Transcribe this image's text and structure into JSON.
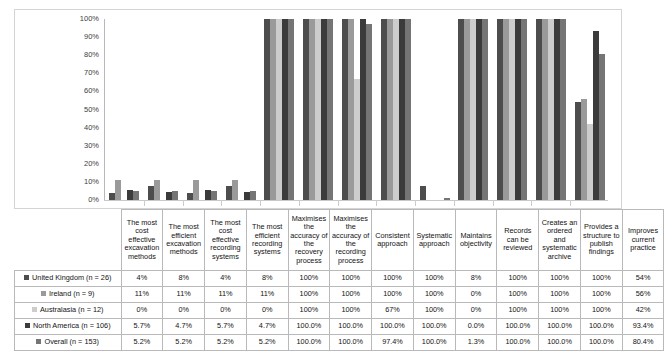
{
  "chart_data": {
    "type": "bar",
    "title": "",
    "xlabel": "",
    "ylabel": "",
    "ylim": [
      0,
      100
    ],
    "grid": false,
    "legend_position": "table-row-headers",
    "ytick_labels": [
      "100%",
      "90%",
      "80%",
      "70%",
      "60%",
      "50%",
      "40%",
      "30%",
      "20%",
      "10%",
      "0%"
    ],
    "ytick_values": [
      100,
      90,
      80,
      70,
      60,
      50,
      40,
      30,
      20,
      10,
      0
    ],
    "categories": [
      "The most cost effective excavation methods",
      "The most efficient excavation methods",
      "The most cost effective recording systems",
      "The most efficient recording systems",
      "Maximises the accuracy of the recovery process",
      "Maximises the accuracy of the recording process",
      "Consistent approach",
      "Systematic approach",
      "Maintains objectivity",
      "Records can be reviewed",
      "Creates an ordered and systematic archive",
      "Provides a structure to publish findings",
      "Improves current practice"
    ],
    "series": [
      {
        "name": "United Kingdom (n = 26)",
        "color": "#4d4d4d",
        "values": [
          4,
          8,
          4,
          8,
          100,
          100,
          100,
          100,
          8,
          100,
          100,
          100,
          54
        ],
        "labels": [
          "4%",
          "8%",
          "4%",
          "8%",
          "100%",
          "100%",
          "100%",
          "100%",
          "8%",
          "100%",
          "100%",
          "100%",
          "54%"
        ]
      },
      {
        "name": "Ireland (n = 9)",
        "color": "#9a9a9a",
        "values": [
          11,
          11,
          11,
          11,
          100,
          100,
          100,
          100,
          0,
          100,
          100,
          100,
          56
        ],
        "labels": [
          "11%",
          "11%",
          "11%",
          "11%",
          "100%",
          "100%",
          "100%",
          "100%",
          "0%",
          "100%",
          "100%",
          "100%",
          "56%"
        ]
      },
      {
        "name": "Australasia (n = 12)",
        "color": "#cdcdcd",
        "values": [
          0,
          0,
          0,
          0,
          100,
          100,
          67,
          100,
          0,
          100,
          100,
          100,
          42
        ],
        "labels": [
          "0%",
          "0%",
          "0%",
          "0%",
          "100%",
          "100%",
          "67%",
          "100%",
          "0%",
          "100%",
          "100%",
          "100%",
          "42%"
        ]
      },
      {
        "name": "North America (n = 106)",
        "color": "#3b3b3b",
        "values": [
          5.7,
          4.7,
          5.7,
          4.7,
          100.0,
          100.0,
          100.0,
          100.0,
          0.0,
          100.0,
          100.0,
          100.0,
          93.4
        ],
        "labels": [
          "5.7%",
          "4.7%",
          "5.7%",
          "4.7%",
          "100.0%",
          "100.0%",
          "100.0%",
          "100.0%",
          "0.0%",
          "100.0%",
          "100.0%",
          "100.0%",
          "93.4%"
        ]
      },
      {
        "name": "Overall (n = 153)",
        "color": "#757575",
        "values": [
          5.2,
          5.2,
          5.2,
          5.2,
          100.0,
          100.0,
          97.4,
          100.0,
          1.3,
          100.0,
          100.0,
          100.0,
          80.4
        ],
        "labels": [
          "5.2%",
          "5.2%",
          "5.2%",
          "5.2%",
          "100.0%",
          "100.0%",
          "97.4%",
          "100.0%",
          "1.3%",
          "100.0%",
          "100.0%",
          "100.0%",
          "80.4%"
        ]
      }
    ]
  }
}
